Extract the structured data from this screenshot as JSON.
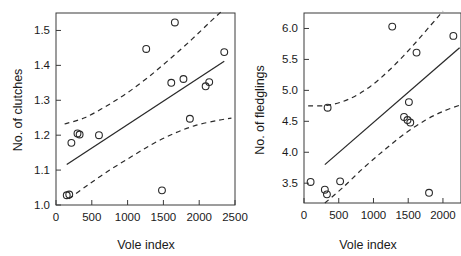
{
  "figure": {
    "name": "two-panel-scatter-regression",
    "background": "#ffffff",
    "line_color": "#2a2a2a"
  },
  "chart_data": [
    {
      "panel": "left",
      "type": "scatter",
      "title": "",
      "xlabel": "Vole index",
      "ylabel": "No. of clutches",
      "xlim": [
        0,
        2500
      ],
      "ylim": [
        1.0,
        1.55
      ],
      "xticks": [
        0,
        500,
        1000,
        1500,
        2000,
        2500
      ],
      "xticklabels": [
        "0",
        "500",
        "1000",
        "1500",
        "2000",
        "2500"
      ],
      "yticks": [
        1.0,
        1.1,
        1.2,
        1.3,
        1.4,
        1.5
      ],
      "yticklabels": [
        "1.0",
        "1.1",
        "1.2",
        "1.3",
        "1.4",
        "1.5"
      ],
      "grid": false,
      "legend": "none",
      "points": [
        {
          "x": 150,
          "y": 1.028
        },
        {
          "x": 185,
          "y": 1.03
        },
        {
          "x": 215,
          "y": 1.178
        },
        {
          "x": 300,
          "y": 1.205
        },
        {
          "x": 330,
          "y": 1.202
        },
        {
          "x": 600,
          "y": 1.2
        },
        {
          "x": 1260,
          "y": 1.447
        },
        {
          "x": 1480,
          "y": 1.042
        },
        {
          "x": 1610,
          "y": 1.35
        },
        {
          "x": 1660,
          "y": 1.523
        },
        {
          "x": 1780,
          "y": 1.361
        },
        {
          "x": 1870,
          "y": 1.247
        },
        {
          "x": 2090,
          "y": 1.34
        },
        {
          "x": 2140,
          "y": 1.352
        },
        {
          "x": 2350,
          "y": 1.438
        }
      ],
      "fit_line": {
        "name": "regression-line",
        "style": "solid",
        "x_start": 150,
        "y_start": 1.116,
        "x_end": 2350,
        "y_end": 1.412
      },
      "confidence_upper": {
        "name": "upper-confidence-band",
        "style": "dashed",
        "points": [
          {
            "x": 120,
            "y": 1.232
          },
          {
            "x": 400,
            "y": 1.25
          },
          {
            "x": 700,
            "y": 1.283
          },
          {
            "x": 1000,
            "y": 1.322
          },
          {
            "x": 1300,
            "y": 1.368
          },
          {
            "x": 1600,
            "y": 1.42
          },
          {
            "x": 1900,
            "y": 1.475
          },
          {
            "x": 2150,
            "y": 1.524
          },
          {
            "x": 2330,
            "y": 1.558
          }
        ]
      },
      "confidence_lower": {
        "name": "lower-confidence-band",
        "style": "dashed",
        "points": [
          {
            "x": 180,
            "y": 1.018
          },
          {
            "x": 450,
            "y": 1.058
          },
          {
            "x": 750,
            "y": 1.1
          },
          {
            "x": 1050,
            "y": 1.138
          },
          {
            "x": 1350,
            "y": 1.175
          },
          {
            "x": 1650,
            "y": 1.205
          },
          {
            "x": 1950,
            "y": 1.228
          },
          {
            "x": 2250,
            "y": 1.242
          },
          {
            "x": 2450,
            "y": 1.249
          }
        ]
      }
    },
    {
      "panel": "right",
      "type": "scatter",
      "title": "",
      "xlabel": "Vole index",
      "ylabel": "No. of fledglings",
      "xlim": [
        0,
        2260
      ],
      "ylim": [
        3.18,
        6.25
      ],
      "xticks": [
        0,
        500,
        1000,
        1500,
        2000
      ],
      "xticklabels": [
        "0",
        "500",
        "1000",
        "1500",
        "2000"
      ],
      "yticks": [
        3.5,
        4.0,
        4.5,
        5.0,
        5.5,
        6.0
      ],
      "yticklabels": [
        "3.5",
        "4.0",
        "4.5",
        "5.0",
        "5.5",
        "6.0"
      ],
      "grid": false,
      "legend": "none",
      "points": [
        {
          "x": 95,
          "y": 3.52
        },
        {
          "x": 300,
          "y": 3.395
        },
        {
          "x": 330,
          "y": 3.32
        },
        {
          "x": 340,
          "y": 4.72
        },
        {
          "x": 520,
          "y": 3.53
        },
        {
          "x": 1270,
          "y": 6.03
        },
        {
          "x": 1440,
          "y": 4.57
        },
        {
          "x": 1490,
          "y": 4.52
        },
        {
          "x": 1510,
          "y": 4.81
        },
        {
          "x": 1530,
          "y": 4.48
        },
        {
          "x": 1620,
          "y": 5.61
        },
        {
          "x": 1800,
          "y": 3.345
        },
        {
          "x": 2150,
          "y": 5.88
        }
      ],
      "fit_line": {
        "name": "regression-line",
        "style": "solid",
        "x_start": 300,
        "y_start": 3.8,
        "x_end": 2240,
        "y_end": 5.69
      },
      "confidence_upper": {
        "name": "upper-confidence-band",
        "style": "dashed",
        "points": [
          {
            "x": 60,
            "y": 4.75
          },
          {
            "x": 350,
            "y": 4.76
          },
          {
            "x": 650,
            "y": 4.86
          },
          {
            "x": 950,
            "y": 5.06
          },
          {
            "x": 1250,
            "y": 5.35
          },
          {
            "x": 1550,
            "y": 5.7
          },
          {
            "x": 1830,
            "y": 6.06
          },
          {
            "x": 2000,
            "y": 6.28
          }
        ]
      },
      "confidence_lower": {
        "name": "lower-confidence-band",
        "style": "dashed",
        "points": [
          {
            "x": 300,
            "y": 3.18
          },
          {
            "x": 550,
            "y": 3.42
          },
          {
            "x": 850,
            "y": 3.74
          },
          {
            "x": 1150,
            "y": 4.03
          },
          {
            "x": 1450,
            "y": 4.3
          },
          {
            "x": 1750,
            "y": 4.52
          },
          {
            "x": 2000,
            "y": 4.66
          },
          {
            "x": 2240,
            "y": 4.76
          }
        ]
      }
    }
  ]
}
